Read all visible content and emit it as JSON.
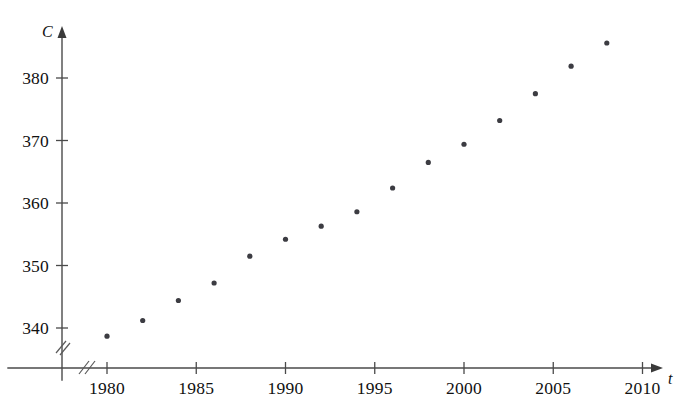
{
  "figure": {
    "background_color": "#ffffff",
    "axis_color": "#4a4a4a",
    "point_color": "#3c3c42",
    "text_color": "#111111"
  },
  "axes": {
    "y": {
      "title": "C",
      "tick_labels": [
        "340",
        "350",
        "360",
        "370",
        "380"
      ],
      "tick_values": [
        340,
        350,
        360,
        370,
        380
      ],
      "has_break": true,
      "break_symbol": "//"
    },
    "x": {
      "title": "t",
      "tick_labels": [
        "1980",
        "1985",
        "1990",
        "1995",
        "2000",
        "2005",
        "2010"
      ],
      "tick_values": [
        1980,
        1985,
        1990,
        1995,
        2000,
        2005,
        2010
      ],
      "has_break": true,
      "break_symbol": "//"
    }
  },
  "chart_data": {
    "type": "scatter",
    "title": "",
    "subtitle": "",
    "xlabel": "t",
    "ylabel": "C",
    "xlim": [
      1978.2,
      2011.5
    ],
    "ylim": [
      336.0,
      388.5
    ],
    "grid": false,
    "legend": null,
    "annotations": [],
    "marker": "circle",
    "marker_size_px": 4,
    "x": [
      1980,
      1982,
      1984,
      1986,
      1988,
      1990,
      1992,
      1994,
      1996,
      1998,
      2000,
      2002,
      2004,
      2006,
      2008
    ],
    "y": [
      338.7,
      341.2,
      344.4,
      347.2,
      351.5,
      354.2,
      356.3,
      358.6,
      362.4,
      366.5,
      369.4,
      373.2,
      377.5,
      381.9,
      385.6
    ],
    "points": [
      {
        "t": 1980,
        "C": 338.7
      },
      {
        "t": 1982,
        "C": 341.2
      },
      {
        "t": 1984,
        "C": 344.4
      },
      {
        "t": 1986,
        "C": 347.2
      },
      {
        "t": 1988,
        "C": 351.5
      },
      {
        "t": 1990,
        "C": 354.2
      },
      {
        "t": 1992,
        "C": 356.3
      },
      {
        "t": 1994,
        "C": 358.6
      },
      {
        "t": 1996,
        "C": 362.4
      },
      {
        "t": 1998,
        "C": 366.5
      },
      {
        "t": 2000,
        "C": 369.4
      },
      {
        "t": 2002,
        "C": 373.2
      },
      {
        "t": 2004,
        "C": 377.5
      },
      {
        "t": 2006,
        "C": 381.9
      },
      {
        "t": 2008,
        "C": 385.6
      }
    ]
  },
  "artifacts": {
    "top_bleed_text": "· · · · · · · · · · · · · · ·"
  }
}
